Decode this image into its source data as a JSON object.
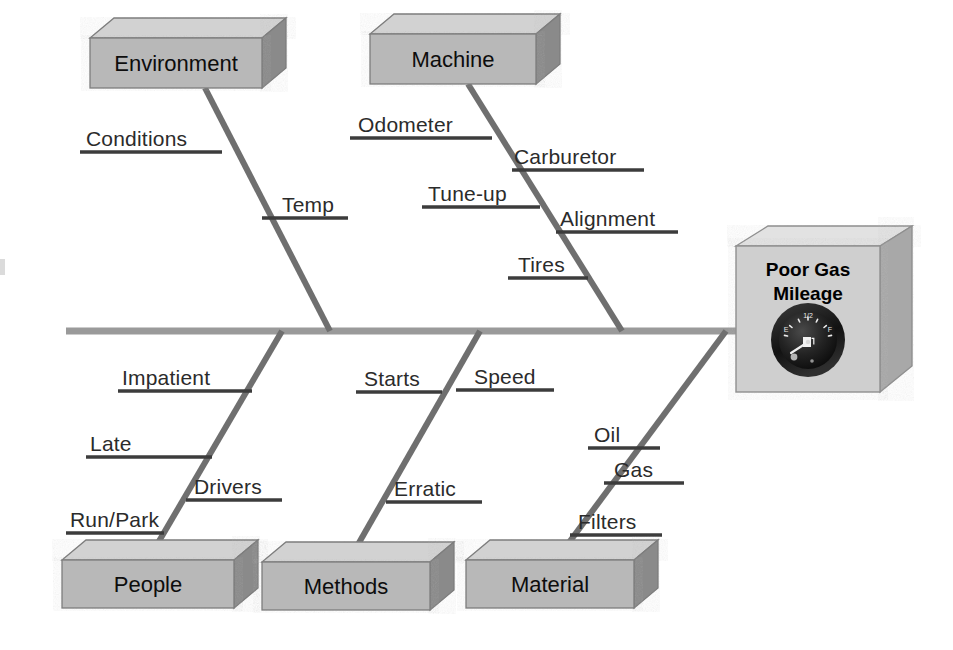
{
  "diagram": {
    "type": "fishbone-ishikawa-cause-and-effect",
    "effect": {
      "title_line1": "Poor Gas",
      "title_line2": "Mileage",
      "icon": "fuel-gauge-icon",
      "gauge": {
        "empty_label": "E",
        "half_label": "1/2",
        "full_label": "F",
        "pump_icon": "fuel-pump-icon"
      }
    },
    "spine": {
      "x1": 66,
      "x2": 742,
      "y": 331,
      "color": "#9a9a9a"
    },
    "colors": {
      "bone": "#6f6f6f",
      "sub_bone": "#3c3c3c",
      "spine": "#9a9a9a",
      "box_front": "#b8b8b8",
      "box_top": "#d2d2d2",
      "box_side": "#8a8a8a",
      "effect_front": "#cfcfcf",
      "effect_top": "#e2e2e2",
      "effect_side": "#a8a8a8",
      "text": "#2b2b2b"
    },
    "categories": [
      {
        "id": "environment",
        "label": "Environment",
        "position": "top",
        "box": {
          "x": 90,
          "y": 38,
          "w": 172,
          "h": 50
        },
        "bone": {
          "x1": 205,
          "y1": 88,
          "x2": 330,
          "y2": 331
        },
        "causes": [
          {
            "label": "Conditions",
            "line_x1": 80,
            "line_x2": 222,
            "line_y": 152,
            "text_x": 86,
            "text_y": 146
          },
          {
            "label": "Temp",
            "line_x1": 262,
            "line_x2": 348,
            "line_y": 218,
            "text_x": 282,
            "text_y": 212
          }
        ]
      },
      {
        "id": "machine",
        "label": "Machine",
        "position": "top",
        "box": {
          "x": 370,
          "y": 34,
          "w": 166,
          "h": 50
        },
        "bone": {
          "x1": 468,
          "y1": 84,
          "x2": 622,
          "y2": 331
        },
        "causes": [
          {
            "label": "Odometer",
            "line_x1": 350,
            "line_x2": 492,
            "line_y": 138,
            "text_x": 358,
            "text_y": 132
          },
          {
            "label": "Carburetor",
            "line_x1": 512,
            "line_x2": 644,
            "line_y": 170,
            "text_x": 514,
            "text_y": 164
          },
          {
            "label": "Tune-up",
            "line_x1": 422,
            "line_x2": 540,
            "line_y": 207,
            "text_x": 428,
            "text_y": 201
          },
          {
            "label": "Alignment",
            "line_x1": 556,
            "line_x2": 678,
            "line_y": 232,
            "text_x": 560,
            "text_y": 226
          },
          {
            "label": "Tires",
            "line_x1": 508,
            "line_x2": 588,
            "line_y": 278,
            "text_x": 518,
            "text_y": 272
          }
        ]
      },
      {
        "id": "people",
        "label": "People",
        "position": "bottom",
        "box": {
          "x": 62,
          "y": 560,
          "w": 172,
          "h": 48
        },
        "bone": {
          "x1": 148,
          "y1": 560,
          "x2": 282,
          "y2": 331
        },
        "causes": [
          {
            "label": "Impatient",
            "line_x1": 118,
            "line_x2": 252,
            "line_y": 391,
            "text_x": 122,
            "text_y": 385
          },
          {
            "label": "Late",
            "line_x1": 86,
            "line_x2": 212,
            "line_y": 457,
            "text_x": 90,
            "text_y": 451
          },
          {
            "label": "Drivers",
            "line_x1": 186,
            "line_x2": 282,
            "line_y": 500,
            "text_x": 194,
            "text_y": 494
          },
          {
            "label": "Run/Park",
            "line_x1": 66,
            "line_x2": 164,
            "line_y": 533,
            "text_x": 70,
            "text_y": 527
          }
        ]
      },
      {
        "id": "methods",
        "label": "Methods",
        "position": "bottom",
        "box": {
          "x": 262,
          "y": 562,
          "w": 168,
          "h": 48
        },
        "bone": {
          "x1": 348,
          "y1": 562,
          "x2": 480,
          "y2": 331
        },
        "causes": [
          {
            "label": "Speed",
            "line_x1": 456,
            "line_x2": 554,
            "line_y": 390,
            "text_x": 474,
            "text_y": 384
          },
          {
            "label": "Starts",
            "line_x1": 356,
            "line_x2": 442,
            "line_y": 392,
            "text_x": 364,
            "text_y": 386
          },
          {
            "label": "Erratic",
            "line_x1": 386,
            "line_x2": 482,
            "line_y": 502,
            "text_x": 394,
            "text_y": 496
          }
        ]
      },
      {
        "id": "material",
        "label": "Material",
        "position": "bottom",
        "box": {
          "x": 466,
          "y": 560,
          "w": 168,
          "h": 48
        },
        "bone": {
          "x1": 556,
          "y1": 560,
          "x2": 726,
          "y2": 331
        },
        "causes": [
          {
            "label": "Oil",
            "line_x1": 588,
            "line_x2": 660,
            "line_y": 448,
            "text_x": 594,
            "text_y": 442
          },
          {
            "label": "Gas",
            "line_x1": 604,
            "line_x2": 684,
            "line_y": 483,
            "text_x": 614,
            "text_y": 477
          },
          {
            "label": "Filters",
            "line_x1": 570,
            "line_x2": 662,
            "line_y": 535,
            "text_x": 578,
            "text_y": 529
          }
        ]
      }
    ]
  }
}
